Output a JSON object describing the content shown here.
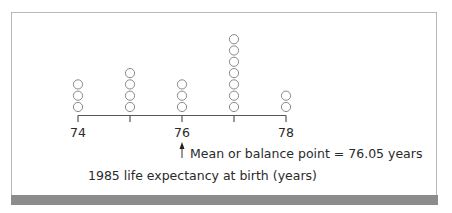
{
  "chart_data": {
    "type": "scatter",
    "subtype": "dot_plot",
    "title": "",
    "xlabel": "1985 life expectancy at birth (years)",
    "ylabel": "",
    "x_ticks": [
      74,
      75,
      76,
      77,
      78
    ],
    "x_tick_labels": [
      "74",
      "",
      "76",
      "",
      "78"
    ],
    "xlim": [
      74,
      78
    ],
    "categories": [
      74,
      75,
      76,
      77,
      78
    ],
    "values": [
      3,
      4,
      3,
      7,
      2
    ],
    "total_count": 19,
    "annotation": {
      "text": "Mean or balance point = 76.05 years",
      "x": 76.05,
      "marker": "up-arrow"
    },
    "grid": false,
    "legend": null
  },
  "labels": {
    "tick_74": "74",
    "tick_76": "76",
    "tick_78": "78",
    "mean_annotation": "Mean or balance point = 76.05 years",
    "axis_title": "1985 life expectancy at birth (years)"
  },
  "colors": {
    "stroke": "#555555",
    "circle_stroke": "#8a8a8a",
    "frame": "#b8b8b8",
    "bottom_bar": "#8c8c8c"
  }
}
